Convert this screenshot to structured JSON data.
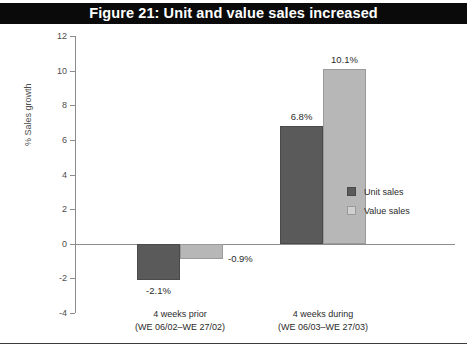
{
  "figure": {
    "title": "Figure 21: Unit and value sales increased",
    "title_band_color": "#0a0a0a",
    "title_text_color": "#ffffff"
  },
  "chart_data": {
    "type": "bar",
    "title": "Figure 21: Unit and value sales increased",
    "xlabel": "",
    "ylabel": "% Sales growth",
    "ylim": [
      -4,
      12
    ],
    "yticks": [
      -4,
      -2,
      0,
      2,
      4,
      6,
      8,
      10,
      12
    ],
    "ytick_labels": [
      "-4",
      "-2",
      "0",
      "2",
      "4",
      "6",
      "8",
      "10",
      "12"
    ],
    "grid": false,
    "legend_position": "right",
    "categories": [
      "4 weeks prior\n(WE 06/02–WE 27/02)",
      "4 weeks during\n(WE 06/03–WE 27/03)"
    ],
    "category_lines": [
      {
        "line1": "4 weeks prior",
        "line2": "(WE 06/02–WE 27/02)"
      },
      {
        "line1": "4 weeks during",
        "line2": "(WE 06/03–WE 27/03)"
      }
    ],
    "series": [
      {
        "name": "Unit sales",
        "color": "#5a5a5a",
        "values": [
          -2.1,
          6.8
        ],
        "data_labels": [
          "-2.1%",
          "6.8%"
        ]
      },
      {
        "name": "Value sales",
        "color": "#b7b7b7",
        "values": [
          -0.9,
          10.1
        ],
        "data_labels": [
          "-0.9%",
          "10.1%"
        ]
      }
    ]
  },
  "legend": {
    "items": [
      {
        "label": "Unit sales",
        "color": "#5a5a5a"
      },
      {
        "label": "Value sales",
        "color": "#d0d0d0"
      }
    ]
  }
}
